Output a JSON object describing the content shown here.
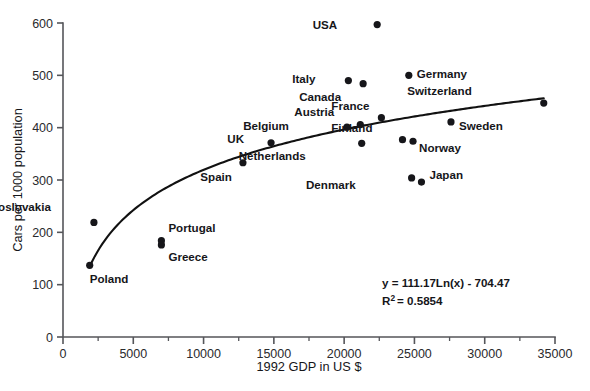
{
  "chart_data": {
    "type": "scatter",
    "title": "",
    "xlabel": "1992 GDP in US $",
    "ylabel": "Cars per 1000 population",
    "xlim": [
      0,
      35000
    ],
    "ylim": [
      0,
      600
    ],
    "xticks": [
      0,
      5000,
      10000,
      15000,
      20000,
      25000,
      30000,
      35000
    ],
    "xtick_labels": [
      "0",
      "5000",
      "10000",
      "15000",
      "20000",
      "25000",
      "30000",
      "35000"
    ],
    "xminor_ticks": [
      2500,
      7500,
      12500,
      17500,
      22500,
      27500,
      32500
    ],
    "yticks": [
      0,
      100,
      200,
      300,
      400,
      500,
      600
    ],
    "ytick_labels": [
      "0",
      "100",
      "200",
      "300",
      "400",
      "500",
      "600"
    ],
    "grid": false,
    "legend": "none",
    "points": [
      {
        "label": "USA",
        "x": 22350,
        "y": 597,
        "label_dx": -40,
        "label_dy": 4
      },
      {
        "label": "Germany",
        "x": 24600,
        "y": 500,
        "label_dx": 8,
        "label_dy": 3
      },
      {
        "label": "Italy",
        "x": 20300,
        "y": 490,
        "label_dx": -33,
        "label_dy": 2
      },
      {
        "label": "Canada",
        "x": 21350,
        "y": 484,
        "label_dx": -22,
        "label_dy": 17
      },
      {
        "label": "Switzerland",
        "x": 34200,
        "y": 447,
        "label_dx": -72,
        "label_dy": -8
      },
      {
        "label": "France",
        "x": 22650,
        "y": 419,
        "label_dx": -12,
        "label_dy": -8
      },
      {
        "label": "Sweden",
        "x": 27600,
        "y": 411,
        "label_dx": 8,
        "label_dy": 8
      },
      {
        "label": "Austria",
        "x": 21150,
        "y": 406,
        "label_dx": -26,
        "label_dy": -9
      },
      {
        "label": "Belgium",
        "x": 20200,
        "y": 401,
        "label_dx": -58,
        "label_dy": 3
      },
      {
        "label": "Finland",
        "x": 24150,
        "y": 377,
        "label_dx": -30,
        "label_dy": -8
      },
      {
        "label": "Norway",
        "x": 24900,
        "y": 374,
        "label_dx": 6,
        "label_dy": 11
      },
      {
        "label": "UK",
        "x": 14800,
        "y": 371,
        "label_dx": -27,
        "label_dy": 0
      },
      {
        "label": "Netherlands",
        "x": 21250,
        "y": 370,
        "label_dx": -56,
        "label_dy": 17
      },
      {
        "label": "Spain",
        "x": 12800,
        "y": 333,
        "label_dx": -11,
        "label_dy": 18
      },
      {
        "label": "Japan",
        "x": 25500,
        "y": 296,
        "label_dx": 8,
        "label_dy": -3
      },
      {
        "label": "Denmark",
        "x": 24800,
        "y": 304,
        "label_dx": -56,
        "label_dy": 11
      },
      {
        "label": "Czechoslovakia",
        "x": 2200,
        "y": 219,
        "label_dx": -43,
        "label_dy": -11
      },
      {
        "label": "Portugal",
        "x": 7000,
        "y": 184,
        "label_dx": 7,
        "label_dy": -9
      },
      {
        "label": "Greece",
        "x": 7000,
        "y": 176,
        "label_dx": 7,
        "label_dy": 16
      },
      {
        "label": "Poland",
        "x": 1900,
        "y": 137,
        "label_dx": 0,
        "label_dy": 18
      }
    ],
    "trendline": {
      "type": "logarithmic",
      "equation": "y = 111.17Ln(x) - 704.47",
      "r_squared_label": "R",
      "r_squared_sup": "2",
      "r_squared_value": "= 0.5854",
      "coefficient": 111.17,
      "intercept": -704.47,
      "r_squared": 0.5854,
      "x_start": 1900,
      "x_end": 34200
    },
    "annotation": {
      "line1": "y = 111.17Ln(x) - 704.47",
      "line2_prefix": "R",
      "line2_sup": "2",
      "line2_suffix": "= 0.5854",
      "x": 22000,
      "y": 120
    }
  },
  "colors": {
    "marker": "#16161a",
    "curve": "#111111",
    "axis": "#55565a",
    "background": "#ffffff"
  },
  "caption": ""
}
